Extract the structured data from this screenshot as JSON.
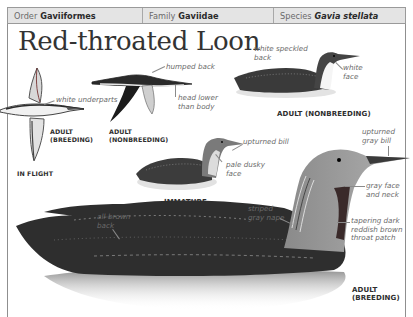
{
  "header": {
    "order": {
      "label": "Order",
      "value": "Gaviiformes"
    },
    "family": {
      "label": "Family",
      "value": "Gaviidae"
    },
    "species": {
      "label": "Species",
      "value": "Gavia stellata"
    }
  },
  "title": "Red-throated Loon",
  "illustrations": {
    "flight_breeding": {
      "caption_line1": "ADULT",
      "caption_line2": "(BREEDING)",
      "notes": [
        "white underparts"
      ]
    },
    "flight_nonbreeding": {
      "caption_line1": "ADULT",
      "caption_line2": "(NONBREEDING)",
      "notes": [
        "humped back",
        "head lower",
        "than body"
      ]
    },
    "in_flight_caption": "IN FLIGHT",
    "adult_nonbreeding": {
      "caption": "ADULT (NONBREEDING)",
      "notes": {
        "speckled_1": "white speckled",
        "speckled_2": "back",
        "face_1": "white",
        "face_2": "face"
      }
    },
    "immature": {
      "caption": "IMMATURE",
      "notes": {
        "bill": "upturned bill",
        "face_1": "pale dusky",
        "face_2": "face"
      }
    },
    "adult_breeding": {
      "caption_line1": "ADULT",
      "caption_line2": "(BREEDING)",
      "notes": {
        "bill_1": "upturned",
        "bill_2": "gray bill",
        "face_1": "gray face",
        "face_2": "and neck",
        "back_1": "all-brown",
        "back_2": "back",
        "nape_1": "striped",
        "nape_2": "gray nape",
        "throat_1": "tapering dark",
        "throat_2": "reddish brown",
        "throat_3": "throat patch"
      }
    }
  },
  "colors": {
    "header_bg": "#e4e4e4",
    "border": "#9a9a9a",
    "title": "#333333",
    "note_text": "#6a6a6a",
    "caption_text": "#2e2e2e"
  }
}
